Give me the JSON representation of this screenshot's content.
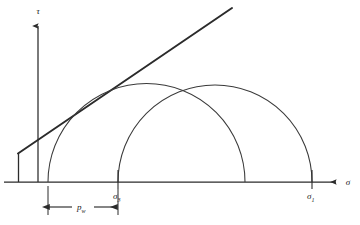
{
  "figure": {
    "ink_color": "#2b2b2b",
    "background_color": "#ffffff"
  },
  "axes": {
    "vertical": {
      "label": "τ",
      "icon": "arrow-up-icon",
      "x": 38,
      "y_top": 22,
      "y_bottom": 182
    },
    "horizontal": {
      "label": "σ",
      "icon": "arrow-right-icon",
      "y": 182,
      "x_left": 4,
      "x_right": 340
    }
  },
  "envelope": {
    "name": "failure-envelope",
    "x1": 18,
    "y1": 153,
    "x2": 232,
    "y2": 8,
    "stroke_width": 1.9
  },
  "cohesion_stub": {
    "name": "cohesion-intercept-stub",
    "x": 18,
    "y_top": 153,
    "y_bottom": 182
  },
  "circles": [
    {
      "name": "mohr-circle-effective",
      "center_x": 146.5,
      "radius": 98.5,
      "left_x": 48,
      "right_x": 245
    },
    {
      "name": "mohr-circle-total",
      "center_x": 215,
      "radius": 97,
      "left_x": 118,
      "right_x": 312
    }
  ],
  "tick_labels": [
    {
      "name": "sigma-3-label",
      "base": "σ",
      "sub": "3",
      "x": 118,
      "y": 196,
      "tick_top": 170,
      "tick_bottom": 189
    },
    {
      "name": "sigma-1-label",
      "base": "σ",
      "sub": "1",
      "x": 312,
      "y": 196,
      "tick_top": 170,
      "tick_bottom": 189
    }
  ],
  "dimension": {
    "name": "pore-pressure-dimension",
    "base": "p",
    "sub": "w",
    "x_start": 48,
    "x_end": 118,
    "y": 207,
    "ext_top": 186,
    "ext_bottom": 215,
    "label_x": 83,
    "label_y": 210
  }
}
